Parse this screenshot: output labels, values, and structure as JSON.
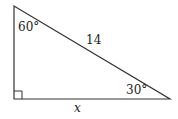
{
  "diagram": {
    "type": "right-triangle",
    "vertices": {
      "top": [
        14,
        6
      ],
      "bottom_left": [
        14,
        99
      ],
      "bottom_right": [
        170,
        99
      ]
    },
    "labels": {
      "top_angle": "60°",
      "hypotenuse": "14",
      "bottom_right_angle": "30°",
      "base": "x"
    },
    "right_angle_marker": "bottom-left",
    "stroke_color": "#333333"
  }
}
